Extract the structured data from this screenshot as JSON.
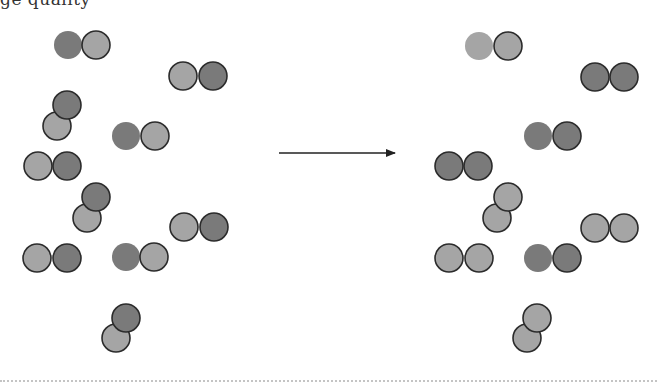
{
  "caption_fragment": "ge quality",
  "colors": {
    "dark": "#7a7a7a",
    "light": "#a5a5a5",
    "border": "#2b2b2b",
    "arrow": "#222222",
    "divider": "#c4c4c4"
  },
  "radius": 14,
  "arrow": {
    "x1": 279,
    "x2": 395,
    "y": 153,
    "label": "reaction-arrow"
  },
  "reactants": [
    {
      "atoms": [
        {
          "x": 68,
          "y": 45,
          "shade": "dark",
          "border": false
        },
        {
          "x": 96,
          "y": 45,
          "shade": "light",
          "border": true
        }
      ]
    },
    {
      "atoms": [
        {
          "x": 183,
          "y": 76,
          "shade": "light",
          "border": true
        },
        {
          "x": 213,
          "y": 76,
          "shade": "dark",
          "border": true
        }
      ]
    },
    {
      "atoms": [
        {
          "x": 57,
          "y": 126,
          "shade": "light",
          "border": true
        },
        {
          "x": 67,
          "y": 105,
          "shade": "dark",
          "border": true
        }
      ]
    },
    {
      "atoms": [
        {
          "x": 126,
          "y": 136,
          "shade": "dark",
          "border": false
        },
        {
          "x": 155,
          "y": 136,
          "shade": "light",
          "border": true
        }
      ]
    },
    {
      "atoms": [
        {
          "x": 38,
          "y": 166,
          "shade": "light",
          "border": true
        },
        {
          "x": 67,
          "y": 166,
          "shade": "dark",
          "border": true
        }
      ]
    },
    {
      "atoms": [
        {
          "x": 87,
          "y": 218,
          "shade": "light",
          "border": true
        },
        {
          "x": 96,
          "y": 197,
          "shade": "dark",
          "border": true
        }
      ]
    },
    {
      "atoms": [
        {
          "x": 184,
          "y": 227,
          "shade": "light",
          "border": true
        },
        {
          "x": 214,
          "y": 227,
          "shade": "dark",
          "border": true
        }
      ]
    },
    {
      "atoms": [
        {
          "x": 37,
          "y": 258,
          "shade": "light",
          "border": true
        },
        {
          "x": 67,
          "y": 258,
          "shade": "dark",
          "border": true
        }
      ]
    },
    {
      "atoms": [
        {
          "x": 126,
          "y": 257,
          "shade": "dark",
          "border": false
        },
        {
          "x": 154,
          "y": 257,
          "shade": "light",
          "border": true
        }
      ]
    },
    {
      "atoms": [
        {
          "x": 116,
          "y": 338,
          "shade": "light",
          "border": true
        },
        {
          "x": 126,
          "y": 318,
          "shade": "dark",
          "border": true
        }
      ]
    }
  ],
  "products": [
    {
      "atoms": [
        {
          "x": 479,
          "y": 46,
          "shade": "light",
          "border": false
        },
        {
          "x": 508,
          "y": 46,
          "shade": "light",
          "border": true
        }
      ]
    },
    {
      "atoms": [
        {
          "x": 595,
          "y": 77,
          "shade": "dark",
          "border": true
        },
        {
          "x": 624,
          "y": 77,
          "shade": "dark",
          "border": true
        }
      ]
    },
    {
      "atoms": [
        {
          "x": 538,
          "y": 136,
          "shade": "dark",
          "border": false
        },
        {
          "x": 567,
          "y": 136,
          "shade": "dark",
          "border": true
        }
      ]
    },
    {
      "atoms": [
        {
          "x": 449,
          "y": 166,
          "shade": "dark",
          "border": true
        },
        {
          "x": 478,
          "y": 166,
          "shade": "dark",
          "border": true
        }
      ]
    },
    {
      "atoms": [
        {
          "x": 497,
          "y": 218,
          "shade": "light",
          "border": true
        },
        {
          "x": 508,
          "y": 197,
          "shade": "light",
          "border": true
        }
      ]
    },
    {
      "atoms": [
        {
          "x": 595,
          "y": 228,
          "shade": "light",
          "border": true
        },
        {
          "x": 624,
          "y": 228,
          "shade": "light",
          "border": true
        }
      ]
    },
    {
      "atoms": [
        {
          "x": 449,
          "y": 258,
          "shade": "light",
          "border": true
        },
        {
          "x": 479,
          "y": 258,
          "shade": "light",
          "border": true
        }
      ]
    },
    {
      "atoms": [
        {
          "x": 538,
          "y": 258,
          "shade": "dark",
          "border": false
        },
        {
          "x": 567,
          "y": 258,
          "shade": "dark",
          "border": true
        }
      ]
    },
    {
      "atoms": [
        {
          "x": 527,
          "y": 338,
          "shade": "light",
          "border": true
        },
        {
          "x": 537,
          "y": 318,
          "shade": "light",
          "border": true
        }
      ]
    }
  ]
}
